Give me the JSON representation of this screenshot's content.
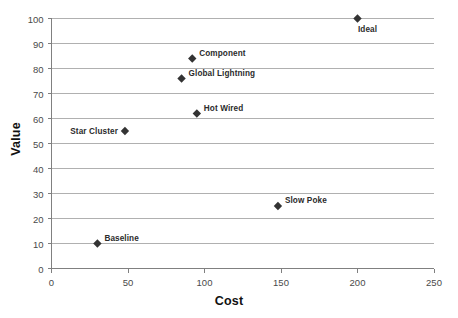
{
  "chart_data": {
    "type": "scatter",
    "title": "",
    "xlabel": "Cost",
    "ylabel": "Value",
    "xlim": [
      0,
      250
    ],
    "ylim": [
      0,
      100
    ],
    "xticks": [
      0,
      50,
      100,
      150,
      200,
      250
    ],
    "yticks": [
      0,
      10,
      20,
      30,
      40,
      50,
      60,
      70,
      80,
      90,
      100
    ],
    "grid": "horizontal",
    "legend": "none",
    "marker": "diamond",
    "marker_color": "#333333",
    "gridline_color": "#b0b0b0",
    "axis_color": "#808080",
    "points": [
      {
        "label": "Baseline",
        "x": 30,
        "y": 10,
        "label_position": "right"
      },
      {
        "label": "Star Cluster",
        "x": 48,
        "y": 55,
        "label_position": "left"
      },
      {
        "label": "Hot Wired",
        "x": 95,
        "y": 62,
        "label_position": "right"
      },
      {
        "label": "Global Lightning",
        "x": 85,
        "y": 76,
        "label_position": "right"
      },
      {
        "label": "Component",
        "x": 92,
        "y": 84,
        "label_position": "right"
      },
      {
        "label": "Slow Poke",
        "x": 148,
        "y": 25,
        "label_position": "right"
      },
      {
        "label": "Ideal",
        "x": 200,
        "y": 100,
        "label_position": "below"
      }
    ]
  },
  "axis": {
    "x_title": "Cost",
    "y_title": "Value",
    "xtick_labels": [
      "0",
      "50",
      "100",
      "150",
      "200",
      "250"
    ],
    "ytick_labels": [
      "0",
      "10",
      "20",
      "30",
      "40",
      "50",
      "60",
      "70",
      "80",
      "90",
      "100"
    ]
  }
}
